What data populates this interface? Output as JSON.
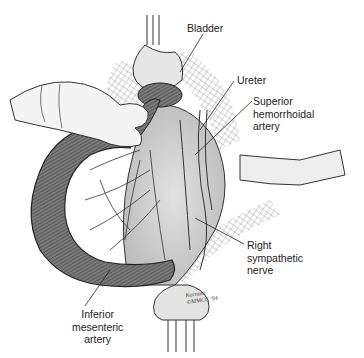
{
  "figure": {
    "type": "anatomical-illustration",
    "style": "grayscale line drawing",
    "colors": {
      "background": "#ffffff",
      "ink": "#222222",
      "tissue_dark": "#5a5a5a",
      "tissue_mid": "#8a8a8a",
      "tissue_light": "#d8d8d8",
      "glove": "#f2f2f2"
    }
  },
  "labels": {
    "bladder": "Bladder",
    "ureter": "Ureter",
    "superior_hemorrhoidal_artery": "Superior\nhemorrhoidal\nartery",
    "right_sympathetic_nerve": "Right\nsympathetic\nnerve",
    "inferior_mesenteric_artery": "Inferior\nmesenteric\nartery"
  },
  "signature": {
    "line1": "Kornuta",
    "line2": "©MMCC '94"
  }
}
